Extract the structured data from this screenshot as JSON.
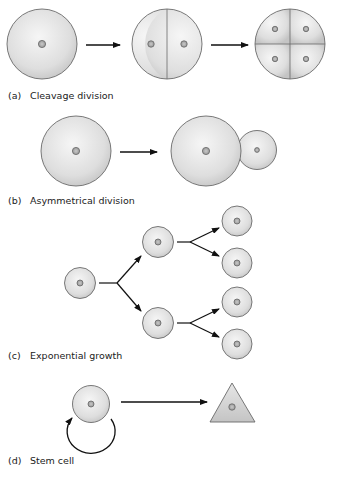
{
  "panels": [
    {
      "id": "a",
      "tag": "(a)",
      "title": "Cleavage division"
    },
    {
      "id": "b",
      "tag": "(b)",
      "title": "Asymmetrical division"
    },
    {
      "id": "c",
      "tag": "(c)",
      "title": "Exponential growth"
    },
    {
      "id": "d",
      "tag": "(d)",
      "title": "Stem cell"
    }
  ],
  "colors": {
    "cell_fill_light": "#f2f2f2",
    "cell_fill_dark": "#c8c8c8",
    "cell_outline": "#6a6a6a",
    "nucleus_fill": "#a8a8a8",
    "arrow": "#111111",
    "triangle_fill": "#d0d0d0"
  }
}
